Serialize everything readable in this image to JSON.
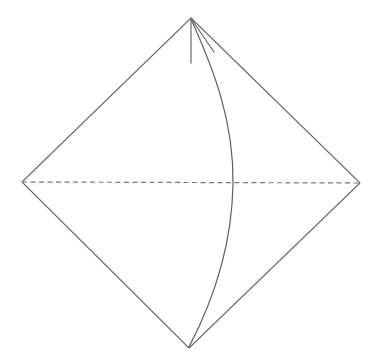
{
  "figure": {
    "background_color": "#ffffff",
    "line_color": "#6b6b6b",
    "dash_color": "#7a7a7a",
    "stroke_width": 1.1,
    "canvas": {
      "width": 382,
      "height": 361
    }
  },
  "vertices": {
    "top": {
      "name": "top-vertex",
      "x": 191,
      "y": 18
    },
    "left": {
      "name": "left-vertex",
      "x": 22,
      "y": 182
    },
    "right": {
      "name": "right-vertex",
      "x": 360,
      "y": 183
    },
    "bottom": {
      "name": "bottom-vertex",
      "x": 189,
      "y": 348
    }
  },
  "shapes": {
    "rhombus": {
      "name": "rhombus-outline",
      "path": "M 191 18 L 22 182 L 189 348 L 360 183 Z",
      "stroke": "#6b6b6b",
      "stroke_width": 1.1,
      "fill": "none"
    },
    "horizontal_diagonal": {
      "name": "horizontal-dashed-diagonal",
      "path": "M 22 182 L 360 183",
      "stroke": "#7a7a7a",
      "stroke_width": 1.2,
      "dash_pattern": "5 3.5",
      "fill": "none"
    },
    "arc": {
      "name": "curved-arc",
      "path": "M 191 19 C 214 70 234 122 233 184 C 232 248 212 303 189 347",
      "stroke": "#5f5f5f",
      "stroke_width": 1.2,
      "fill": "none",
      "crossing_point": {
        "x": 233,
        "y": 183
      }
    },
    "stub_vertical": {
      "name": "apex-vertical-stub",
      "path": "M 191 20 L 191 63",
      "stroke": "#6b6b6b",
      "stroke_width": 1.2,
      "fill": "none"
    },
    "stub_slanted": {
      "name": "apex-slanted-stub",
      "path": "M 192 20 L 214 52",
      "stroke": "#6b6b6b",
      "stroke_width": 1.2,
      "fill": "none"
    }
  }
}
